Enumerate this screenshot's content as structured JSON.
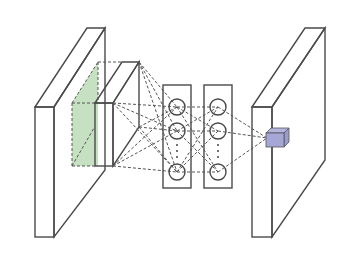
{
  "diagram": {
    "type": "neural-network-architecture",
    "colors": {
      "input_slab": "#a9bde3",
      "conv_block": "#bcdcb6",
      "fc_layer": "#f1c3b2",
      "node": "#d3d8dd",
      "output_slab": "#f3e3b6",
      "output_voxel": "#a5a8d6",
      "stroke": "#4a4a4a"
    },
    "components": [
      {
        "id": "input-volume",
        "kind": "slab",
        "color_key": "input_slab"
      },
      {
        "id": "conv-feature-block",
        "kind": "block",
        "color_key": "conv_block"
      },
      {
        "id": "fc-layer-1",
        "kind": "layer",
        "nodes": 3,
        "ellipsis": true
      },
      {
        "id": "fc-layer-2",
        "kind": "layer",
        "nodes": 3,
        "ellipsis": true
      },
      {
        "id": "output-volume",
        "kind": "slab",
        "color_key": "output_slab"
      },
      {
        "id": "output-voxel",
        "kind": "cube",
        "color_key": "output_voxel"
      }
    ]
  }
}
